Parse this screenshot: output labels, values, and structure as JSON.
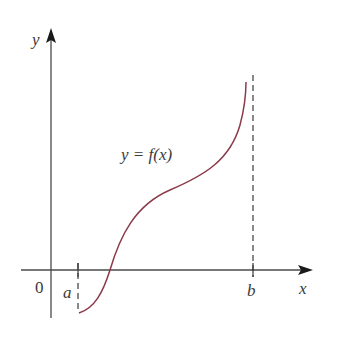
{
  "figure": {
    "type": "function-graph",
    "colors": {
      "axis": "#4a4a4a",
      "curve": "#8b3a4a",
      "dashed": "#3a3a3a",
      "text": "#3a3a3a",
      "background": "#ffffff"
    },
    "axes": {
      "x_label": "x",
      "y_label": "y",
      "origin_label": "0"
    },
    "markers": [
      {
        "label": "a",
        "style": "dashed"
      },
      {
        "label": "b",
        "style": "dashed"
      }
    ],
    "curve_label": "y = f(x)"
  }
}
